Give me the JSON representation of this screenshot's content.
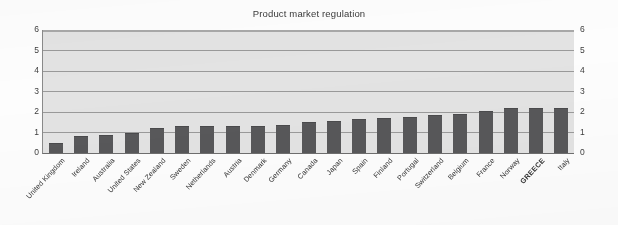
{
  "chart_data": {
    "type": "bar",
    "title": "Product market regulation",
    "xlabel": "",
    "ylabel": "",
    "ylim": [
      0,
      6
    ],
    "yticks": [
      "0",
      "1",
      "2",
      "3",
      "4",
      "5",
      "6"
    ],
    "grid": true,
    "legend": null,
    "axis_right": true,
    "highlight_category": "GREECE",
    "bar_color": "#58585a",
    "plot_background": "#e3e3e3",
    "categories": [
      "United Kingdom",
      "Ireland",
      "Australia",
      "United States",
      "New Zealand",
      "Sweden",
      "Netherlands",
      "Austria",
      "Denmark",
      "Germany",
      "Canada",
      "Japan",
      "Spain",
      "Finland",
      "Portugal",
      "Switzerland",
      "Belgium",
      "France",
      "Norway",
      "GREECE",
      "Italy"
    ],
    "values": [
      0.5,
      0.85,
      0.9,
      1.0,
      1.2,
      1.3,
      1.3,
      1.3,
      1.32,
      1.38,
      1.5,
      1.55,
      1.65,
      1.7,
      1.75,
      1.85,
      1.9,
      2.05,
      2.2,
      2.18,
      2.2
    ]
  }
}
